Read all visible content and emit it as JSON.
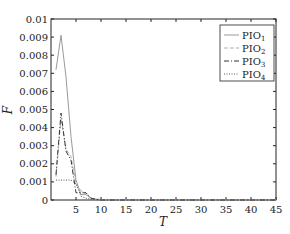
{
  "chart_data": {
    "type": "line",
    "title": "",
    "xlabel": "T",
    "ylabel": "F",
    "xlim": [
      0,
      45
    ],
    "ylim": [
      0,
      0.01
    ],
    "xticks": [
      5,
      10,
      15,
      20,
      25,
      30,
      35,
      40,
      45
    ],
    "yticks": [
      0,
      0.001,
      0.002,
      0.003,
      0.004,
      0.005,
      0.006,
      0.007,
      0.008,
      0.009,
      0.01
    ],
    "ytick_labels": [
      "0",
      "0.001",
      "0.002",
      "0.003",
      "0.004",
      "0.005",
      "0.006",
      "0.007",
      "0.008",
      "0.009",
      "0.01"
    ],
    "grid": false,
    "legend_position": "upper right",
    "series": [
      {
        "name": "PIO1",
        "label_base": "PIO",
        "label_sub": "1",
        "style": "solid",
        "color": "#9a9a9a",
        "x": [
          1,
          2,
          3,
          4,
          5,
          6,
          7,
          8,
          9,
          10,
          15,
          20,
          25,
          30,
          35,
          40,
          45
        ],
        "y": [
          0.0072,
          0.0091,
          0.0068,
          0.0035,
          0.0011,
          0.0003,
          0.0003,
          0.0001,
          5e-05,
          2e-05,
          0,
          0,
          0,
          0,
          0,
          0,
          0
        ]
      },
      {
        "name": "PIO2",
        "label_base": "PIO",
        "label_sub": "2",
        "style": "dashed",
        "color": "#b0b0b0",
        "x": [
          1,
          2,
          3,
          4,
          5,
          6,
          7,
          8,
          9,
          10,
          15,
          20,
          25,
          30,
          35,
          40,
          45
        ],
        "y": [
          0.0013,
          0.0045,
          0.0028,
          0.0024,
          0.0009,
          0.0005,
          0.0004,
          0.0001,
          3e-05,
          0,
          0,
          0,
          0,
          0,
          0,
          0,
          0
        ]
      },
      {
        "name": "PIO3",
        "label_base": "PIO",
        "label_sub": "3",
        "style": "dashdot",
        "color": "#333333",
        "x": [
          1,
          2,
          3,
          4,
          5,
          6,
          7,
          8,
          9,
          10,
          15,
          20,
          25,
          30,
          35,
          40,
          45
        ],
        "y": [
          0.0014,
          0.0048,
          0.0027,
          0.0022,
          0.0004,
          0.0004,
          0.0004,
          0.0001,
          3e-05,
          0,
          0,
          0,
          0,
          0,
          0,
          0,
          0
        ]
      },
      {
        "name": "PIO4",
        "label_base": "PIO",
        "label_sub": "4",
        "style": "dotted",
        "color": "#555555",
        "x": [
          1,
          2,
          3,
          4,
          5,
          6,
          7,
          8,
          9,
          10,
          15,
          20,
          25,
          30,
          35,
          40,
          45
        ],
        "y": [
          0.0011,
          0.0011,
          0.0011,
          0.0011,
          0.0009,
          0.0002,
          0.0001,
          5e-05,
          2e-05,
          0,
          0,
          0,
          0,
          0,
          0,
          0,
          0
        ]
      }
    ]
  }
}
